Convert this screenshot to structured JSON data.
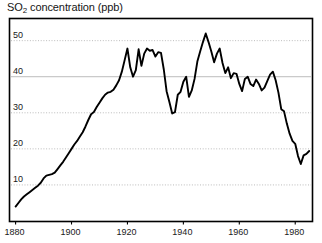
{
  "chart_data": {
    "type": "line",
    "title": "SO2 concentration (ppb)",
    "title_main": "SO",
    "title_sub": "2",
    "title_rest": " concentration (ppb)",
    "xlabel": "",
    "ylabel": "",
    "units": "ppb",
    "grid": true,
    "grid_axis": "y",
    "legend": "none",
    "line_color": "#000000",
    "grid_color": "#b4b4b4",
    "frame_color": "#000000",
    "background_color": "#ffffff",
    "xlim": [
      1878,
      1986
    ],
    "ylim": [
      0,
      56
    ],
    "xticks": [
      1880,
      1900,
      1920,
      1940,
      1960,
      1980
    ],
    "xtick_labels": [
      "1880",
      "1900",
      "1920",
      "1940",
      "1960",
      "1980"
    ],
    "yticks": [
      10,
      20,
      30,
      40,
      50
    ],
    "ytick_labels": [
      "10",
      "20",
      "30",
      "40",
      "50"
    ],
    "x": [
      1880,
      1881,
      1882,
      1883,
      1884,
      1885,
      1886,
      1887,
      1888,
      1889,
      1890,
      1891,
      1892,
      1893,
      1894,
      1895,
      1896,
      1897,
      1898,
      1899,
      1900,
      1901,
      1902,
      1903,
      1904,
      1905,
      1906,
      1907,
      1908,
      1909,
      1910,
      1911,
      1912,
      1913,
      1914,
      1915,
      1916,
      1917,
      1918,
      1919,
      1920,
      1921,
      1922,
      1923,
      1924,
      1925,
      1926,
      1927,
      1928,
      1929,
      1930,
      1931,
      1932,
      1933,
      1934,
      1935,
      1936,
      1937,
      1938,
      1939,
      1940,
      1941,
      1942,
      1943,
      1944,
      1945,
      1946,
      1947,
      1948,
      1949,
      1950,
      1951,
      1952,
      1953,
      1954,
      1955,
      1956,
      1957,
      1958,
      1959,
      1960,
      1961,
      1962,
      1963,
      1964,
      1965,
      1966,
      1967,
      1968,
      1969,
      1970,
      1971,
      1972,
      1973,
      1974,
      1975,
      1976,
      1977,
      1978,
      1979,
      1980,
      1981,
      1982,
      1983,
      1984,
      1985
    ],
    "values": [
      4.0,
      5.0,
      6.0,
      6.8,
      7.4,
      8.0,
      8.6,
      9.2,
      9.8,
      10.6,
      11.8,
      12.6,
      12.8,
      13.0,
      13.4,
      14.4,
      15.4,
      16.4,
      17.6,
      18.8,
      20.0,
      21.2,
      22.2,
      23.4,
      24.6,
      26.2,
      28.0,
      29.6,
      30.2,
      31.6,
      32.8,
      34.0,
      35.0,
      35.6,
      35.8,
      36.4,
      37.6,
      39.0,
      41.4,
      44.6,
      47.8,
      42.6,
      40.0,
      41.8,
      47.6,
      43.0,
      46.4,
      47.8,
      47.2,
      47.4,
      45.6,
      46.8,
      46.6,
      42.0,
      36.0,
      33.0,
      29.8,
      30.2,
      35.0,
      35.8,
      38.6,
      40.0,
      34.4,
      36.2,
      39.4,
      44.2,
      47.0,
      49.6,
      52.0,
      49.6,
      47.0,
      44.0,
      46.4,
      47.8,
      43.8,
      41.0,
      42.6,
      39.6,
      41.0,
      40.8,
      38.0,
      36.0,
      39.4,
      40.0,
      38.0,
      37.4,
      39.2,
      38.0,
      36.2,
      37.0,
      38.8,
      40.6,
      41.4,
      39.0,
      35.6,
      31.0,
      30.4,
      27.0,
      24.2,
      22.2,
      21.4,
      18.0,
      15.8,
      18.2,
      18.6,
      19.4
    ]
  }
}
